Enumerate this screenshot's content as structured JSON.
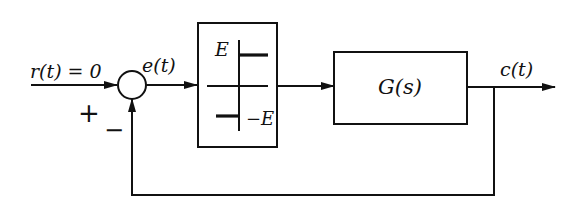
{
  "diagram": {
    "type": "block-diagram",
    "title": "",
    "input": {
      "label": "r(t) = 0"
    },
    "summing_junction": {
      "plus_sign": "+",
      "minus_sign": "−"
    },
    "error_signal": {
      "label": "e(t)"
    },
    "nonlinear_block": {
      "kind": "ideal-relay",
      "upper_level_label": "E",
      "lower_level_label": "−E"
    },
    "plant_block": {
      "label": "G(s)"
    },
    "output": {
      "label": "c(t)"
    },
    "feedback": {
      "type": "unity-negative"
    }
  },
  "colors": {
    "stroke": "#111111",
    "background": "#ffffff"
  }
}
